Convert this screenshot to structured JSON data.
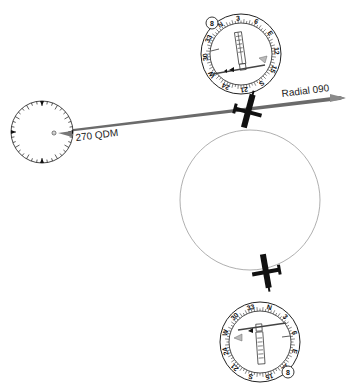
{
  "labels": {
    "radial": "Radial 090",
    "qdm": "270 QDM"
  },
  "ndb_dial": {
    "cx": 42,
    "cy": 132,
    "r": 33,
    "name": "ndb-station-dial"
  },
  "hsi_top": {
    "cx": 241,
    "cy": 54,
    "r": 44,
    "course_window": "8",
    "marks": [
      "N",
      "3",
      "6",
      "E",
      "12",
      "15",
      "S",
      "21",
      "24",
      "W",
      "30",
      "33"
    ]
  },
  "hsi_bottom": {
    "cx": 260,
    "cy": 342,
    "r": 44,
    "course_window": "8",
    "marks": [
      "N",
      "3",
      "6",
      "E",
      "12",
      "15",
      "S",
      "21",
      "24",
      "W",
      "30",
      "33"
    ]
  },
  "orbit_circle": {
    "cx": 250,
    "cy": 200,
    "r": 90
  },
  "colors": {
    "line": "#555555",
    "arrow": "#777777",
    "ink": "#111111",
    "circle": "#999999"
  }
}
